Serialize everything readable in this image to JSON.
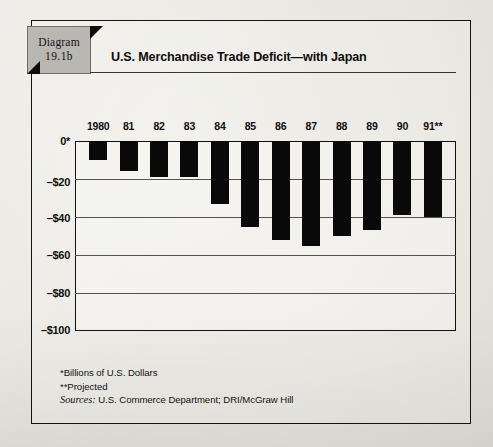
{
  "figure": {
    "tab_line1": "Diagram",
    "tab_line2": "19.1b",
    "title": "U.S. Merchandise Trade Deficit—with Japan"
  },
  "footnotes": {
    "units": "*Billions of U.S. Dollars",
    "projected": "**Projected",
    "sources_label": "Sources:",
    "sources_text": "U.S. Commerce Department; DRI/McGraw Hill"
  },
  "colors": {
    "bar": "#09090a",
    "frame": "#111111",
    "grid": "#555250",
    "tab_fill": "#b9b7b2",
    "paper": "#e9e7e1"
  },
  "chart_data": {
    "type": "bar",
    "title": "U.S. Merchandise Trade Deficit—with Japan",
    "xlabel": "",
    "ylabel": "",
    "ylim": [
      -100,
      0
    ],
    "grid": true,
    "legend": "none",
    "orientation": "vertical-negative",
    "units": "Billions of U.S. Dollars",
    "categories": [
      "1980",
      "81",
      "82",
      "83",
      "84",
      "85",
      "86",
      "87",
      "88",
      "89",
      "90",
      "91**"
    ],
    "values": [
      -10,
      -16,
      -19,
      -19,
      -33,
      -45,
      -52,
      -55,
      -50,
      -47,
      -39,
      -40
    ],
    "ytick_labels": [
      "0*",
      "–$20",
      "–$40",
      "–$60",
      "–$80",
      "–$100"
    ],
    "ytick_values": [
      0,
      -20,
      -40,
      -60,
      -80,
      -100
    ]
  }
}
